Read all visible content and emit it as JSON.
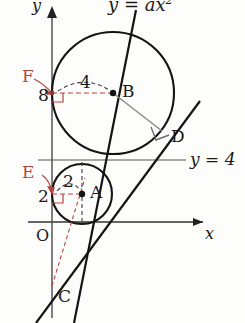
{
  "figure": {
    "kind": "geometry-diagram",
    "background_color": "#fdfdfb",
    "stroke_color": "#1a1a1a",
    "accent_color": "#b5443f",
    "radius_line_color": "#7b7b7b"
  },
  "axes": {
    "x_label": "x",
    "y_label": "y",
    "origin_label": "O"
  },
  "curve_label": "y = ax",
  "curve_label_exponent": "2",
  "horizontal_line_label": "y = 4",
  "points": [
    {
      "name": "A",
      "label": "A",
      "cx": 82,
      "cy": 194,
      "role": "small-circle-center"
    },
    {
      "name": "B",
      "label": "B",
      "cx": 113,
      "cy": 93,
      "role": "large-circle-center"
    },
    {
      "name": "C",
      "label": "C",
      "cx": 52,
      "cy": 286,
      "role": "line-y-axis-intersection"
    },
    {
      "name": "D",
      "label": "D",
      "cx": 162,
      "cy": 131,
      "role": "tangent-point-large-circle"
    },
    {
      "name": "E",
      "label": "E",
      "cx": 52,
      "cy": 194,
      "role": "foot-from-A-to-y-axis"
    },
    {
      "name": "F",
      "label": "F",
      "cx": 52,
      "cy": 93,
      "role": "foot-from-B-to-y-axis"
    }
  ],
  "measurements": [
    {
      "name": "radius-small",
      "value": "2",
      "at": "arc from E to A"
    },
    {
      "name": "y-of-A",
      "value": "2",
      "at": "y-axis tick at A level"
    },
    {
      "name": "radius-large",
      "value": "4",
      "at": "arc from F to B"
    },
    {
      "name": "y-of-B",
      "value": "8",
      "at": "y-axis tick at B level"
    }
  ],
  "circles": [
    {
      "name": "small-circle",
      "center": "A",
      "cx": 82,
      "cy": 194,
      "r": 30
    },
    {
      "name": "large-circle",
      "center": "B",
      "cx": 113,
      "cy": 93,
      "r": 61
    }
  ],
  "markers": {
    "right_angle_at_D": true,
    "right_angle_at_E": true,
    "right_angle_at_F": true
  }
}
